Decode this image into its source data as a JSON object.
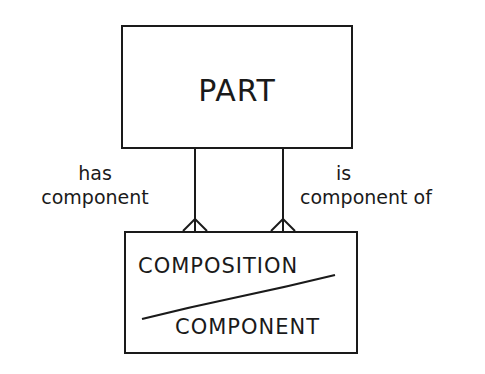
{
  "diagram": {
    "type": "entity-relationship",
    "entities": [
      {
        "id": "part",
        "label": "PART"
      },
      {
        "id": "composition",
        "label_top": "COMPOSITION",
        "label_bottom": "COMPONENT",
        "note": "split by diagonal line"
      }
    ],
    "relationships": [
      {
        "from": "part",
        "to": "composition",
        "label_line1": "has",
        "label_line2": "component",
        "cardinality_end": "crows-foot"
      },
      {
        "from": "part",
        "to": "composition",
        "label_line1": "is",
        "label_line2": "component of",
        "cardinality_end": "crows-foot"
      }
    ]
  },
  "colors": {
    "stroke": "#1a1a1a",
    "background": "#ffffff"
  }
}
